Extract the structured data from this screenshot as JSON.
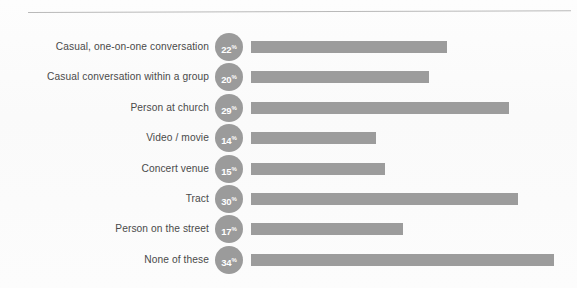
{
  "chart_data": {
    "type": "bar",
    "orientation": "horizontal",
    "title": "",
    "subtitle": "",
    "xlabel": "",
    "ylabel": "",
    "xlim": [
      0,
      34
    ],
    "grid": false,
    "legend": false,
    "value_suffix": "%",
    "categories": [
      "Casual, one-on-one conversation",
      "Casual conversation within a group",
      "Person at church",
      "Video / movie",
      "Concert venue",
      "Tract",
      "Person on the street",
      "None of these"
    ],
    "values": [
      22,
      20,
      29,
      14,
      15,
      30,
      17,
      34
    ],
    "value_labels": [
      "22%",
      "20%",
      "29%",
      "14%",
      "15%",
      "30%",
      "17%",
      "34%"
    ],
    "series": [
      {
        "name": "",
        "values": [
          22,
          20,
          29,
          14,
          15,
          30,
          17,
          34
        ]
      }
    ]
  },
  "style": {
    "bar_color": "#9c9c9c",
    "badge_color": "#9b9b9b",
    "badge_text_color": "#ffffff",
    "label_color": "#4a4a4a",
    "rule_color": "#b9b9b9",
    "background_color": "#fbfbfb"
  },
  "rows": [
    {
      "label": "Casual, one-on-one conversation",
      "value": 22,
      "value_number": "22",
      "value_suffix": "%"
    },
    {
      "label": "Casual conversation within a group",
      "value": 20,
      "value_number": "20",
      "value_suffix": "%"
    },
    {
      "label": "Person at church",
      "value": 29,
      "value_number": "29",
      "value_suffix": "%"
    },
    {
      "label": "Video / movie",
      "value": 14,
      "value_number": "14",
      "value_suffix": "%"
    },
    {
      "label": "Concert venue",
      "value": 15,
      "value_number": "15",
      "value_suffix": "%"
    },
    {
      "label": "Tract",
      "value": 30,
      "value_number": "30",
      "value_suffix": "%"
    },
    {
      "label": "Person on the street",
      "value": 17,
      "value_number": "17",
      "value_suffix": "%"
    },
    {
      "label": "None of these",
      "value": 34,
      "value_number": "34",
      "value_suffix": "%"
    }
  ]
}
